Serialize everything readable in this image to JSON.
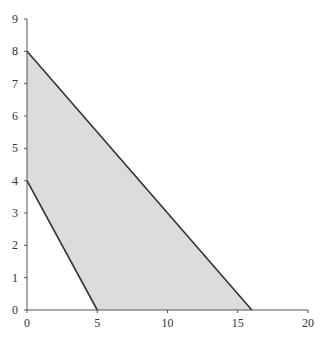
{
  "chart_data": {
    "type": "area",
    "title": "",
    "xlabel": "",
    "ylabel": "",
    "xlim": [
      0,
      20
    ],
    "ylim": [
      0,
      9
    ],
    "grid": false,
    "x_ticks": [
      0,
      5,
      10,
      15,
      20
    ],
    "y_ticks": [
      0,
      1,
      2,
      3,
      4,
      5,
      6,
      7,
      8,
      9
    ],
    "series": [
      {
        "name": "upper boundary",
        "type": "line",
        "x": [
          0,
          16
        ],
        "y": [
          8,
          0
        ]
      },
      {
        "name": "lower boundary",
        "type": "line",
        "x": [
          0,
          5
        ],
        "y": [
          4,
          0
        ]
      }
    ],
    "shaded_region": {
      "vertices": [
        [
          0,
          8
        ],
        [
          16,
          0
        ],
        [
          5,
          0
        ],
        [
          0,
          4
        ]
      ],
      "fill": "#d9d9d9"
    }
  },
  "colors": {
    "fill": "#dcdcdc",
    "line": "#333333",
    "axis": "#555555"
  }
}
